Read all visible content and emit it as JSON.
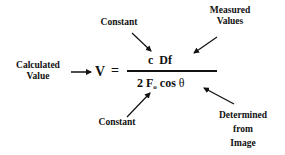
{
  "labels": {
    "constant_top": "Constant",
    "measured_values_line1": "Measured",
    "measured_values_line2": "Values",
    "calculated_value_line1": "Calculated",
    "calculated_value_line2": "Value",
    "constant_bottom": "Constant",
    "determined_line1": "Determined",
    "determined_line2": "from",
    "determined_line3": "Image"
  },
  "equation": {
    "lhs": "V",
    "equals": "=",
    "numerator_c": "c",
    "numerator_df": "Df",
    "denominator_2": "2",
    "denominator_F": "F",
    "denominator_sub": "o",
    "denominator_cos": "cos",
    "denominator_theta": "θ"
  },
  "colors": {
    "text": "#111111",
    "background": "#ffffff"
  }
}
